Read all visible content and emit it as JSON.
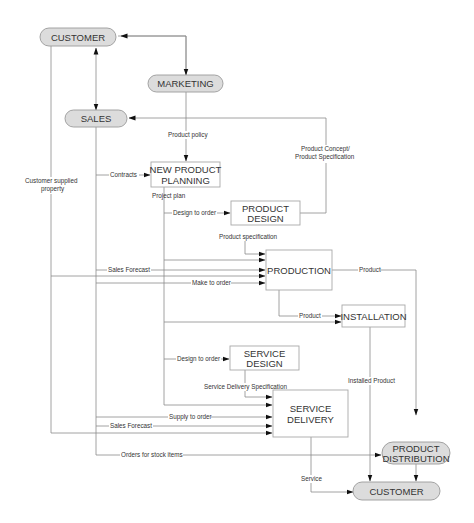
{
  "diagram": {
    "type": "process-flow",
    "nodes": {
      "customer_top": "CUSTOMER",
      "marketing": "MARKETING",
      "sales": "SALES",
      "new_product_planning_1": "NEW PRODUCT",
      "new_product_planning_2": "PLANNING",
      "product_design_1": "PRODUCT",
      "product_design_2": "DESIGN",
      "production": "PRODUCTION",
      "installation": "INSTALLATION",
      "service_design_1": "SERVICE",
      "service_design_2": "DESIGN",
      "service_delivery_1": "SERVICE",
      "service_delivery_2": "DELIVERY",
      "product_distribution_1": "PRODUCT",
      "product_distribution_2": "DISTRIBUTION",
      "customer_bottom": "CUSTOMER"
    },
    "edges": {
      "product_policy": "Product policy",
      "product_concept_1": "Product Concept/",
      "product_concept_2": "Product Specification",
      "contracts": "Contracts",
      "customer_supplied_1": "Customer supplied",
      "customer_supplied_2": "property",
      "project_plan": "Project plan",
      "design_to_order_product": "Design to order",
      "product_specification": "Product specification",
      "sales_forecast_production": "Sales Forecast",
      "make_to_order": "Make to order",
      "product_to_distribution": "Product",
      "product_to_installation": "Product",
      "design_to_order_service": "Design to order",
      "service_delivery_specification": "Service Delivery Specification",
      "installed_product": "Installed Product",
      "supply_to_order": "Supply to order",
      "sales_forecast_service": "Sales Forecast",
      "orders_for_stock_items": "Orders for stock items",
      "service": "Service"
    }
  }
}
